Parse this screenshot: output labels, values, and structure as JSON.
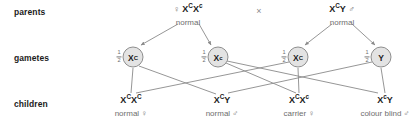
{
  "diagram": {
    "line_color": "#8a8a8a",
    "text_color": "#1b1b1b",
    "muted_color": "#6e6e6e",
    "gamete_fill": "#e3e3e3",
    "background": "#ffffff"
  },
  "row_labels": {
    "parents": "parents",
    "gametes": "gametes",
    "children": "children"
  },
  "cross_symbol": "×",
  "symbols": {
    "female": "♀",
    "male": "♂"
  },
  "parents": [
    {
      "id": "mother",
      "sex_symbol": "♀",
      "sex_position": "before",
      "allele1": "X",
      "sup1": "C",
      "allele2": "X",
      "sup2": "c",
      "genotype_plain": "XᶜXᶜ",
      "phenotype": "normal",
      "x": 188,
      "y": 10
    },
    {
      "id": "father",
      "sex_symbol": "♂",
      "sex_position": "after",
      "allele1": "X",
      "sup1": "C",
      "allele2": "Y",
      "sup2": "",
      "genotype_plain": "XᶜY",
      "phenotype": "normal",
      "x": 342,
      "y": 10
    }
  ],
  "gametes": [
    {
      "id": "gamete-1",
      "allele": "X",
      "sup": "C",
      "fraction_num": "1",
      "fraction_den": "2",
      "from": "mother",
      "x": 133,
      "y": 57
    },
    {
      "id": "gamete-2",
      "allele": "X",
      "sup": "c",
      "fraction_num": "1",
      "fraction_den": "2",
      "from": "mother",
      "x": 218,
      "y": 57
    },
    {
      "id": "gamete-3",
      "allele": "X",
      "sup": "C",
      "fraction_num": "1",
      "fraction_den": "2",
      "from": "father",
      "x": 298,
      "y": 57
    },
    {
      "id": "gamete-4",
      "allele": "Y",
      "sup": "",
      "fraction_num": "1",
      "fraction_den": "2",
      "from": "father",
      "x": 381,
      "y": 57
    }
  ],
  "children": [
    {
      "id": "child-1",
      "allele1": "X",
      "sup1": "C",
      "allele2": "X",
      "sup2": "C",
      "genotype_plain": "XᶜXᶜ",
      "phenotype": "normal",
      "sex_symbol": "♀",
      "x": 131,
      "y": 100
    },
    {
      "id": "child-2",
      "allele1": "X",
      "sup1": "C",
      "allele2": "Y",
      "sup2": "",
      "genotype_plain": "XᶜY",
      "phenotype": "normal",
      "sex_symbol": "♂",
      "x": 222,
      "y": 100
    },
    {
      "id": "child-3",
      "allele1": "X",
      "sup1": "C",
      "allele2": "X",
      "sup2": "c",
      "genotype_plain": "XᶜXᶜ",
      "phenotype": "carrier",
      "sex_symbol": "♀",
      "x": 299,
      "y": 100
    },
    {
      "id": "child-4",
      "allele1": "X",
      "sup1": "c",
      "allele2": "Y",
      "sup2": "",
      "genotype_plain": "XᶜY",
      "phenotype": "colour blind",
      "sex_symbol": "♂",
      "x": 385,
      "y": 100
    }
  ]
}
